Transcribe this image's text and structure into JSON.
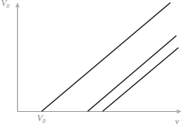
{
  "chart_data": {
    "type": "line",
    "title": "",
    "xlabel": "v",
    "ylabel": "V0",
    "xlabel_plain": "v",
    "ylabel_plain": "V",
    "ylabel_sub": "0",
    "xlabel_sub": "",
    "grid": false,
    "legend": null,
    "axis_style": "arrow-axes",
    "xlim": [
      0,
      1
    ],
    "ylim": [
      0,
      1
    ],
    "annotations": [
      {
        "name": "x-intercept-label",
        "text": "V",
        "sub": "0",
        "x": 42,
        "y": 111
      }
    ],
    "series": [
      {
        "name": "line-1",
        "x": [
          0.153,
          0.935
        ],
        "y": [
          0.0,
          0.972
        ],
        "start_px": [
          42,
          111
        ],
        "end_px": [
          170,
          3
        ],
        "color": "#3b3b3b"
      },
      {
        "name": "line-2",
        "x": [
          0.434,
          0.972
        ],
        "y": [
          0.0,
          0.676
        ],
        "start_px": [
          88,
          111
        ],
        "end_px": [
          176,
          36
        ],
        "color": "#3b3b3b"
      },
      {
        "name": "line-3",
        "x": [
          0.528,
          0.982
        ],
        "y": [
          0.0,
          0.568
        ],
        "start_px": [
          103,
          111
        ],
        "end_px": [
          178,
          48
        ],
        "color": "#3b3b3b"
      }
    ],
    "axes": {
      "x_axis_px": {
        "x1": 17,
        "y1": 111,
        "x2": 181,
        "y2": 111
      },
      "y_axis_px": {
        "x1": 17,
        "y1": 112,
        "x2": 17,
        "y2": 3
      },
      "color": "#b0b0b0"
    },
    "colors": {
      "background": "#ffffff",
      "axis": "#b0b0b0",
      "line": "#3b3b3b",
      "label": "#8a8a8a"
    }
  }
}
